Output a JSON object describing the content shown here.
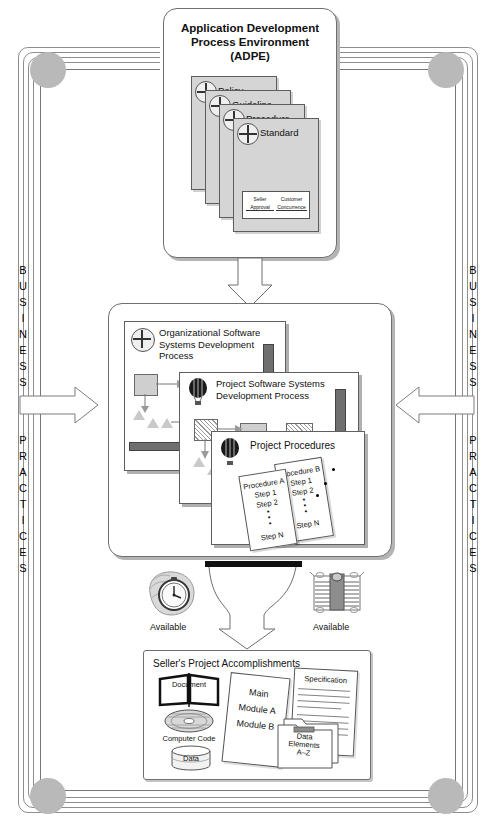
{
  "diagram": {
    "title_frame_left": [
      "B",
      "U",
      "S",
      "I",
      "N",
      "E",
      "S",
      "S"
    ],
    "title_frame_left2": [
      "P",
      "R",
      "A",
      "C",
      "T",
      "I",
      "C",
      "E",
      "S"
    ],
    "business_word": "BUSINESS",
    "practices_word": "PRACTICES"
  },
  "adpe": {
    "title_line1": "Application Development",
    "title_line2": "Process Environment",
    "title_line3": "(ADPE)",
    "documents": [
      {
        "label": "Policy"
      },
      {
        "label": "Guideline"
      },
      {
        "label": "Procedure"
      },
      {
        "label": "Standard"
      }
    ],
    "approval": {
      "seller_line1": "Seller",
      "seller_line2": "Approval",
      "customer_line1": "Customer",
      "customer_line2": "Concurrence"
    }
  },
  "middle": {
    "org_process": {
      "line1": "Organizational Software",
      "line2": "Systems Development",
      "line3": "Process"
    },
    "project_process": {
      "line1": "Project Software Systems",
      "line2": "Development Process"
    },
    "project_procedures": {
      "title": "Project Procedures",
      "procedure_a": {
        "name": "Procedure A",
        "steps": [
          "Step 1",
          "Step 2",
          "•",
          "•",
          "•",
          "Step N"
        ]
      },
      "procedure_b": {
        "name": "Procedure B",
        "steps": [
          "Step 1",
          "Step 2",
          "•",
          "•",
          "•",
          "Step N"
        ]
      }
    }
  },
  "prescriptive": {
    "label_line1": "Prescriptive",
    "label_line2": "Application",
    "available_left": "Available",
    "available_right": "Available",
    "left_resource_icon": "stopwatch-in-hand-icon",
    "right_resource_icon": "stack-of-documents-icon"
  },
  "accomplishments": {
    "title": "Seller's Project Accomplishments",
    "document_label": "Document",
    "computer_code_label": "Computer Code",
    "data_label": "Data",
    "code_sheet": [
      "Main",
      "Module A",
      "Module B"
    ],
    "specification_label": "Specification",
    "data_elements": [
      "Data",
      "Elements",
      "A–Z"
    ]
  },
  "colors": {
    "frame": "#8d8d8d",
    "corner_circle": "#b9b9b9",
    "card_gray": "#d5d5d5",
    "shadow": "#b4b4b4",
    "bar_black": "#111111"
  }
}
